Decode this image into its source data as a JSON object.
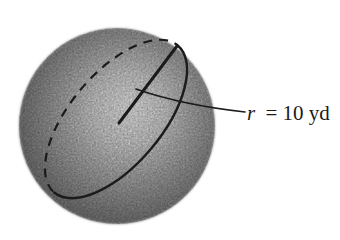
{
  "figure": {
    "type": "sphere-diagram",
    "radius_label": {
      "symbol": "r",
      "rest": "= 10 yd",
      "full": "r = 10 yd"
    },
    "colors": {
      "background": "#ffffff",
      "ink": "#1b1b1b"
    },
    "sphere_shading": [
      "#f8f8f8",
      "#dcdcdc",
      "#b4b4b4",
      "#8e8e8e",
      "#707070"
    ]
  }
}
